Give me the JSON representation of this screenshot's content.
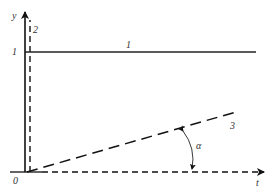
{
  "diagram": {
    "type": "line-graph-schematic",
    "axes": {
      "x_label": "t",
      "y_label": "y",
      "origin_label": "0",
      "y_tick_label": "1"
    },
    "lines": [
      {
        "id": "1",
        "label": "1",
        "style": "solid",
        "description": "horizontal step at y = 1"
      },
      {
        "id": "2",
        "label": "2",
        "style": "dashed",
        "description": "vertical line at t = 0"
      },
      {
        "id": "3",
        "label": "3",
        "style": "dashed",
        "description": "ramp from origin with slope angle alpha"
      }
    ],
    "angle": {
      "label": "α"
    },
    "colors": {
      "stroke": "#111111",
      "text": "#333333",
      "background": "#ffffff"
    }
  }
}
